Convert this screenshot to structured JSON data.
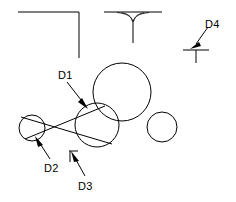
{
  "drawing": {
    "title": "tangent-circles-dimension-sketch",
    "background_color": "#ffffff",
    "line_color": "#000000",
    "canvas": {
      "width": 236,
      "height": 202
    }
  },
  "labels": [
    {
      "id": "D1",
      "text": "D1",
      "x": 58,
      "y": 70
    },
    {
      "id": "D2",
      "text": "D2",
      "x": 44,
      "y": 163
    },
    {
      "id": "D3",
      "text": "D3",
      "x": 78,
      "y": 181
    },
    {
      "id": "D4",
      "text": "D4",
      "x": 205,
      "y": 19
    }
  ],
  "circles": [
    {
      "id": "large-circle",
      "cx": 122,
      "cy": 92,
      "r": 29
    },
    {
      "id": "medium-circle",
      "cx": 97,
      "cy": 125,
      "r": 22
    },
    {
      "id": "small-left-circle",
      "cx": 32,
      "cy": 128,
      "r": 13
    },
    {
      "id": "small-right-circle",
      "cx": 162,
      "cy": 127,
      "r": 15
    }
  ],
  "corner_profile": {
    "id": "top-left-corner",
    "horizontal": {
      "x1": 18,
      "y1": 12,
      "x2": 79,
      "y2": 12
    },
    "vertical": {
      "x1": 79,
      "y1": 12,
      "x2": 79,
      "y2": 58
    }
  },
  "tee_profile": {
    "id": "top-center-tee",
    "horizontal": {
      "x1": 104,
      "y1": 12,
      "x2": 162,
      "y2": 12
    },
    "vertical": {
      "x1": 133,
      "y1": 18,
      "x2": 133,
      "y2": 43
    },
    "fillet_left": "M 118 12 Q 131 13 133 23",
    "fillet_right": "M 148 12 Q 135 13 133 23"
  },
  "tee_small": {
    "id": "bottom-right-tee",
    "horizontal": {
      "x1": 183,
      "y1": 50,
      "x2": 209,
      "y2": 50
    },
    "vertical": {
      "x1": 196,
      "y1": 50,
      "x2": 196,
      "y2": 62
    }
  },
  "tangent_lines": [
    {
      "id": "internal-tangent-upper",
      "x1": 22,
      "y1": 118,
      "x2": 110,
      "y2": 142
    },
    {
      "id": "internal-tangent-lower",
      "x1": 24,
      "y1": 138,
      "x2": 106,
      "y2": 108
    }
  ],
  "tick_mark": {
    "id": "d3-tick",
    "horizontal": {
      "x1": 69,
      "y1": 151,
      "x2": 78,
      "y2": 151
    },
    "vertical": {
      "x1": 70,
      "y1": 151,
      "x2": 70,
      "y2": 161
    }
  },
  "leaders": [
    {
      "id": "leader-d1",
      "label": "D1",
      "line": {
        "x1": 67,
        "y1": 82,
        "x2": 84,
        "y2": 104
      },
      "arrow_tip": {
        "x": 87,
        "y": 108
      },
      "arrow_angle_deg": 52
    },
    {
      "id": "leader-d2",
      "label": "D2",
      "line": {
        "x1": 50,
        "y1": 159,
        "x2": 38,
        "y2": 141
      },
      "arrow_tip": {
        "x": 35,
        "y": 137
      },
      "arrow_angle_deg": 236
    },
    {
      "id": "leader-d3",
      "label": "D3",
      "line": {
        "x1": 85,
        "y1": 176,
        "x2": 74,
        "y2": 157
      },
      "arrow_tip": {
        "x": 71,
        "y": 152
      },
      "arrow_angle_deg": 240
    },
    {
      "id": "leader-d4",
      "label": "D4",
      "line": {
        "x1": 207,
        "y1": 28,
        "x2": 195,
        "y2": 44
      },
      "arrow_tip": {
        "x": 191,
        "y": 49
      },
      "arrow_angle_deg": 128
    }
  ]
}
